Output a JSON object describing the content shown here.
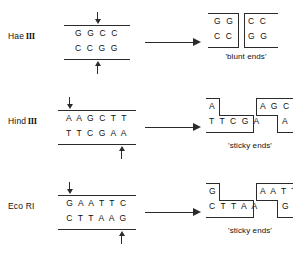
{
  "figure": {
    "rows": [
      {
        "enzyme_name": "Hae",
        "enzyme_numeral": "III",
        "substrate": {
          "top_strand": "G G C C",
          "bottom_strand": "C C G G",
          "top_cut_arrow": "down-arrow-icon",
          "bottom_cut_arrow": "up-arrow-icon"
        },
        "reaction_arrow": "right-arrow-icon",
        "products": {
          "left_fragment": {
            "top": "G G",
            "bottom": "C C"
          },
          "right_fragment": {
            "top": "C C",
            "bottom": "G G"
          },
          "caption": "'blunt ends'"
        }
      },
      {
        "enzyme_name": "Hind",
        "enzyme_numeral": "III",
        "substrate": {
          "top_strand": "A A G C T T",
          "bottom_strand": "T T C G A A",
          "top_cut_arrow": "down-arrow-icon",
          "bottom_cut_arrow": "up-arrow-icon"
        },
        "reaction_arrow": "right-arrow-icon",
        "products": {
          "left_fragment": {
            "top": "A",
            "bottom": "T T C G A"
          },
          "right_fragment": {
            "top": "A G C T T",
            "bottom": "A"
          },
          "caption": "'sticky ends'"
        }
      },
      {
        "enzyme_name": "Eco",
        "enzyme_numeral": "RI",
        "substrate": {
          "top_strand": "G A A T T C",
          "bottom_strand": "C T T A A G",
          "top_cut_arrow": "down-arrow-icon",
          "bottom_cut_arrow": "up-arrow-icon"
        },
        "reaction_arrow": "right-arrow-icon",
        "products": {
          "left_fragment": {
            "top": "G",
            "bottom": "C T T A A"
          },
          "right_fragment": {
            "top": "A A T T C",
            "bottom": "G"
          },
          "caption": "'sticky ends'"
        }
      }
    ],
    "colors": {
      "ink": "#2b2b2b",
      "text": "#111111",
      "background": "#ffffff"
    }
  }
}
